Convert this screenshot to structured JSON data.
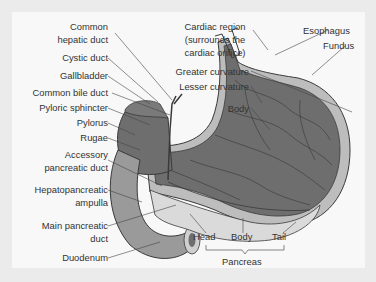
{
  "figure": {
    "left_labels": [
      {
        "id": "common-hepatic-duct",
        "lines": [
          "Common",
          "hepatic duct"
        ]
      },
      {
        "id": "cystic-duct",
        "lines": [
          "Cystic duct"
        ]
      },
      {
        "id": "gallbladder",
        "lines": [
          "Gallbladder"
        ]
      },
      {
        "id": "common-bile-duct",
        "lines": [
          "Common bile duct"
        ]
      },
      {
        "id": "pyloric-sphincter",
        "lines": [
          "Pyloric sphincter"
        ]
      },
      {
        "id": "pylorus",
        "lines": [
          "Pylorus"
        ]
      },
      {
        "id": "rugae",
        "lines": [
          "Rugae"
        ]
      },
      {
        "id": "accessory-pancreatic-duct",
        "lines": [
          "Accessory",
          "pancreatic duct"
        ]
      },
      {
        "id": "hepatopancreatic-ampulla",
        "lines": [
          "Hepatopancreatic",
          "ampulla"
        ]
      },
      {
        "id": "main-pancreatic-duct",
        "lines": [
          "Main pancreatic",
          "duct"
        ]
      },
      {
        "id": "duodenum",
        "lines": [
          "Duodenum"
        ]
      }
    ],
    "top_labels": [
      {
        "id": "cardiac-region",
        "lines": [
          "Cardiac region",
          "(surrounds the",
          "cardiac orifice)"
        ]
      },
      {
        "id": "esophagus",
        "lines": [
          "Esophagus"
        ]
      },
      {
        "id": "fundus",
        "lines": [
          "Fundus"
        ]
      },
      {
        "id": "greater-curvature",
        "lines": [
          "Greater curvature"
        ]
      },
      {
        "id": "lesser-curvature",
        "lines": [
          "Lesser curvature"
        ]
      },
      {
        "id": "body",
        "lines": [
          "Body"
        ]
      }
    ],
    "pancreas_labels": {
      "head": "Head",
      "body": "Body",
      "tail": "Tail",
      "group": "Pancreas"
    },
    "colors": {
      "stomach_interior": "#6e6e6e",
      "stomach_wall": "#b8b8b8",
      "pancreas": "#d8d8d8",
      "duodenum": "#9a9a9a",
      "outline": "#3a3a3a"
    }
  }
}
